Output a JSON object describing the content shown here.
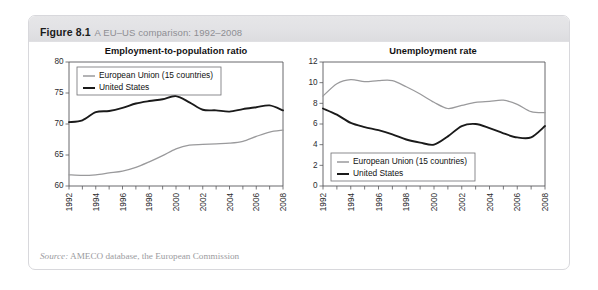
{
  "figure": {
    "number": "Figure 8.1",
    "title": "A EU–US comparison: 1992–2008",
    "source_label": "Source:",
    "source_text": " AMECO database, the European Commission"
  },
  "legend": {
    "eu_label": "European Union (15 countries)",
    "us_label": "United States",
    "eu_color": "#9a9a9c",
    "us_color": "#1a1a1a"
  },
  "chart_data": [
    {
      "type": "line",
      "title": "Employment-to-population ratio",
      "xlabel": "",
      "ylabel": "",
      "xlim": [
        1992,
        2008
      ],
      "ylim": [
        60,
        80
      ],
      "yticks": [
        60,
        65,
        70,
        75,
        80
      ],
      "ytick_labels": [
        "60",
        "65",
        "70",
        "75",
        "80"
      ],
      "x": [
        1992,
        1993,
        1994,
        1995,
        1996,
        1997,
        1998,
        1999,
        2000,
        2001,
        2002,
        2003,
        2004,
        2005,
        2006,
        2007,
        2008
      ],
      "xtick_labels": [
        "1992",
        "",
        "1994",
        "",
        "1996",
        "",
        "1998",
        "",
        "2000",
        "",
        "2002",
        "",
        "2004",
        "",
        "2006",
        "",
        "2008"
      ],
      "grid": false,
      "legend_position": "top-left",
      "series": [
        {
          "name": "European Union (15 countries)",
          "color": "#9a9a9c",
          "values": [
            61.8,
            61.7,
            61.8,
            62.1,
            62.4,
            63.0,
            63.9,
            64.9,
            66.0,
            66.6,
            66.7,
            66.8,
            66.9,
            67.2,
            68.0,
            68.7,
            69.0
          ]
        },
        {
          "name": "United States",
          "color": "#1a1a1a",
          "values": [
            70.3,
            70.6,
            71.9,
            72.1,
            72.6,
            73.3,
            73.7,
            74.0,
            74.5,
            73.5,
            72.3,
            72.2,
            72.0,
            72.4,
            72.7,
            73.0,
            72.2
          ]
        }
      ]
    },
    {
      "type": "line",
      "title": "Unemployment rate",
      "xlabel": "",
      "ylabel": "",
      "xlim": [
        1992,
        2008
      ],
      "ylim": [
        0,
        12
      ],
      "yticks": [
        0,
        2,
        4,
        6,
        8,
        10,
        12
      ],
      "ytick_labels": [
        "0",
        "2",
        "4",
        "6",
        "8",
        "10",
        "12"
      ],
      "x": [
        1992,
        1993,
        1994,
        1995,
        1996,
        1997,
        1998,
        1999,
        2000,
        2001,
        2002,
        2003,
        2004,
        2005,
        2006,
        2007,
        2008
      ],
      "xtick_labels": [
        "1992",
        "",
        "1994",
        "",
        "1996",
        "",
        "1998",
        "",
        "2000",
        "",
        "2002",
        "",
        "2004",
        "",
        "2006",
        "",
        "2008"
      ],
      "grid": false,
      "legend_position": "bottom-left",
      "series": [
        {
          "name": "European Union (15 countries)",
          "color": "#9a9a9c",
          "values": [
            8.7,
            9.9,
            10.3,
            10.1,
            10.2,
            10.2,
            9.6,
            8.9,
            8.1,
            7.5,
            7.8,
            8.1,
            8.2,
            8.3,
            7.9,
            7.2,
            7.1
          ]
        },
        {
          "name": "United States",
          "color": "#1a1a1a",
          "values": [
            7.5,
            6.9,
            6.1,
            5.7,
            5.4,
            5.0,
            4.5,
            4.2,
            4.0,
            4.8,
            5.8,
            6.0,
            5.6,
            5.1,
            4.7,
            4.7,
            5.8
          ]
        }
      ]
    }
  ]
}
